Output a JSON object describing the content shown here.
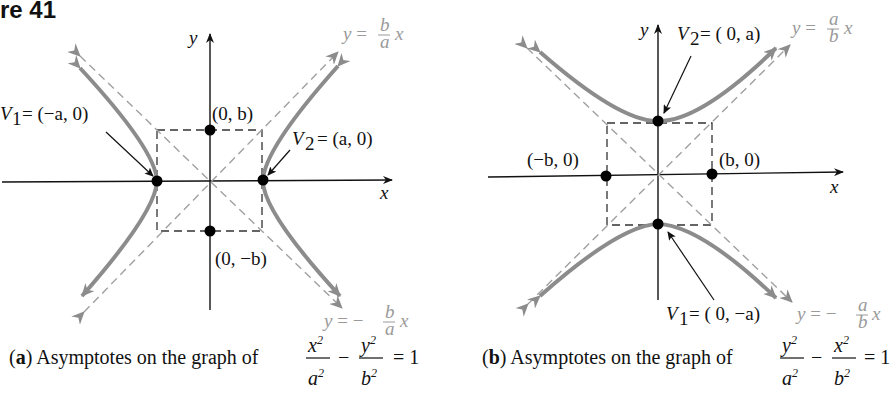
{
  "figure": {
    "title": "re 41",
    "panels": [
      {
        "id": "a",
        "caption_letter": "a",
        "caption_text": "Asymptotes on the graph of",
        "equation": {
          "num1": "x",
          "den1": "a",
          "minus": "−",
          "num2": "y",
          "den2": "b",
          "rhs": "= 1",
          "exp": "2"
        },
        "axis_x_label": "x",
        "axis_y_label": "y",
        "asymptote_pos": {
          "lhs": "y =",
          "num": "b",
          "den": "a",
          "var": "x"
        },
        "asymptote_neg": {
          "lhs": "y = −",
          "num": "b",
          "den": "a",
          "var": "x"
        },
        "points": [
          {
            "label": "(0, b)"
          },
          {
            "label": "(0, −b)"
          }
        ],
        "vertices": [
          {
            "name": "V",
            "sub": "1",
            "value": "= (−a, 0)"
          },
          {
            "name": "V",
            "sub": "2",
            "value": "= (a, 0)"
          }
        ]
      },
      {
        "id": "b",
        "caption_letter": "b",
        "caption_text": "Asymptotes on the graph of",
        "equation": {
          "num1": "y",
          "den1": "a",
          "minus": "−",
          "num2": "x",
          "den2": "b",
          "rhs": "= 1",
          "exp": "2"
        },
        "axis_x_label": "x",
        "axis_y_label": "y",
        "asymptote_pos": {
          "lhs": "y =",
          "num": "a",
          "den": "b",
          "var": "x"
        },
        "asymptote_neg": {
          "lhs": "y = −",
          "num": "a",
          "den": "b",
          "var": "x"
        },
        "points": [
          {
            "label": "(−b, 0)"
          },
          {
            "label": "(b, 0)"
          }
        ],
        "vertices": [
          {
            "name": "V",
            "sub": "2",
            "value": "= ( 0, a)"
          },
          {
            "name": "V",
            "sub": "1",
            "value": "= ( 0, −a)"
          }
        ]
      }
    ],
    "colors": {
      "curve": "#8c8c8c",
      "asymptote": "#a0a0a0",
      "axis": "#111111",
      "point": "#000000",
      "label_gray": "#9a9a9a"
    }
  }
}
